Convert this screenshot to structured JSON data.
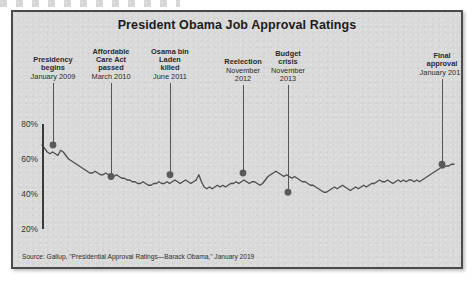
{
  "figure": {
    "title": "President Obama Job Approval Ratings",
    "source": "Source: Gallup, \"Presidential Approval Ratings—Barack Obama,\" January 2019",
    "frame_color": "#4a4a4a",
    "panel_color": "#d9d9d9",
    "line_color": "#4d4d4d",
    "marker_color": "#5a5a5a"
  },
  "annotations": [
    {
      "head": "Presidency\nbegins",
      "date": "January 2009",
      "x": 40,
      "label_x": 40,
      "label_y": 44,
      "label_w": 56,
      "value": 68
    },
    {
      "head": "Affordable\nCare Act\npassed",
      "date": "March 2010",
      "x": 98,
      "label_x": 98,
      "label_y": 36,
      "label_w": 52,
      "value": 50
    },
    {
      "head": "Osama bin\nLaden\nkilled",
      "date": "June 2011",
      "x": 157,
      "label_x": 157,
      "label_y": 36,
      "label_w": 50,
      "value": 51
    },
    {
      "head": "Reelection",
      "date": "November\n2012",
      "x": 230,
      "label_x": 230,
      "label_y": 46,
      "label_w": 52,
      "value": 52
    },
    {
      "head": "Budget\ncrisis",
      "date": "November\n2013",
      "x": 275,
      "label_x": 275,
      "label_y": 38,
      "label_w": 48,
      "value": 41
    },
    {
      "head": "Final\napproval",
      "date": "January 2017",
      "x": 429,
      "label_x": 429,
      "label_y": 40,
      "label_w": 56,
      "value": 57
    }
  ],
  "chart_data": {
    "type": "line",
    "title": "President Obama Job Approval Ratings",
    "xlabel": "",
    "ylabel": "",
    "ylim": [
      20,
      80
    ],
    "yticks": [
      20,
      40,
      60,
      80
    ],
    "ytick_labels": [
      "20%",
      "40%",
      "60%",
      "80%"
    ],
    "grid": false,
    "legend": "none",
    "series": [
      {
        "name": "Job approval",
        "units": "percent",
        "x_start": "January 2009",
        "x_end": "January 2017",
        "values": [
          68,
          66,
          64,
          63,
          64,
          63,
          62,
          65,
          64,
          62,
          60,
          59,
          58,
          57,
          56,
          55,
          54,
          53,
          52,
          52,
          53,
          52,
          51,
          51,
          52,
          51,
          50,
          50,
          51,
          50,
          49,
          49,
          48,
          48,
          47,
          47,
          46,
          46,
          47,
          46,
          45,
          45,
          46,
          46,
          47,
          46,
          46,
          47,
          46,
          47,
          48,
          47,
          46,
          47,
          48,
          47,
          46,
          47,
          48,
          51,
          47,
          44,
          43,
          44,
          43,
          44,
          45,
          44,
          45,
          44,
          45,
          46,
          46,
          47,
          46,
          47,
          48,
          47,
          46,
          47,
          47,
          46,
          45,
          46,
          48,
          50,
          51,
          52,
          53,
          52,
          51,
          50,
          51,
          50,
          49,
          50,
          49,
          48,
          47,
          47,
          46,
          45,
          45,
          44,
          43,
          42,
          41,
          41,
          42,
          43,
          44,
          43,
          44,
          45,
          44,
          43,
          42,
          43,
          44,
          43,
          44,
          45,
          44,
          45,
          46,
          46,
          47,
          48,
          47,
          47,
          48,
          47,
          46,
          47,
          48,
          47,
          48,
          47,
          48,
          48,
          47,
          48,
          47,
          48,
          49,
          50,
          51,
          52,
          53,
          54,
          55,
          55,
          56,
          56,
          57,
          57
        ],
        "marker_points": [
          {
            "label": "Presidency begins",
            "value": 68
          },
          {
            "label": "Affordable Care Act passed",
            "value": 50
          },
          {
            "label": "Osama bin Laden killed",
            "value": 51
          },
          {
            "label": "Reelection",
            "value": 52
          },
          {
            "label": "Budget crisis",
            "value": 41
          },
          {
            "label": "Final approval",
            "value": 57
          }
        ]
      }
    ]
  }
}
